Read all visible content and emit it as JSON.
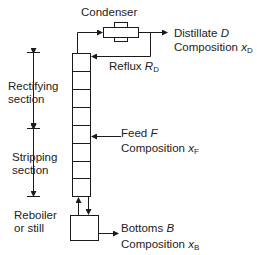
{
  "diagram": {
    "condenser": {
      "label": "Condenser"
    },
    "distillate": {
      "label": "Distillate",
      "symbol": "D",
      "composition_label": "Composition",
      "composition_symbol": "x",
      "composition_sub": "D"
    },
    "reflux": {
      "label": "Reflux",
      "symbol": "R",
      "sub": "D"
    },
    "rectifying": {
      "line1": "Rectifying",
      "line2": "section"
    },
    "stripping": {
      "line1": "Stripping",
      "line2": "section"
    },
    "feed": {
      "label": "Feed",
      "symbol": "F",
      "composition_label": "Composition",
      "composition_symbol": "x",
      "composition_sub": "F"
    },
    "reboiler": {
      "line1": "Reboiler",
      "line2": "or still"
    },
    "bottoms": {
      "label": "Bottoms",
      "symbol": "B",
      "composition_label": "Composition",
      "composition_symbol": "x",
      "composition_sub": "B"
    },
    "column": {
      "trays": 8
    },
    "colors": {
      "stroke": "#1a1a1a",
      "background": "#ffffff"
    }
  }
}
